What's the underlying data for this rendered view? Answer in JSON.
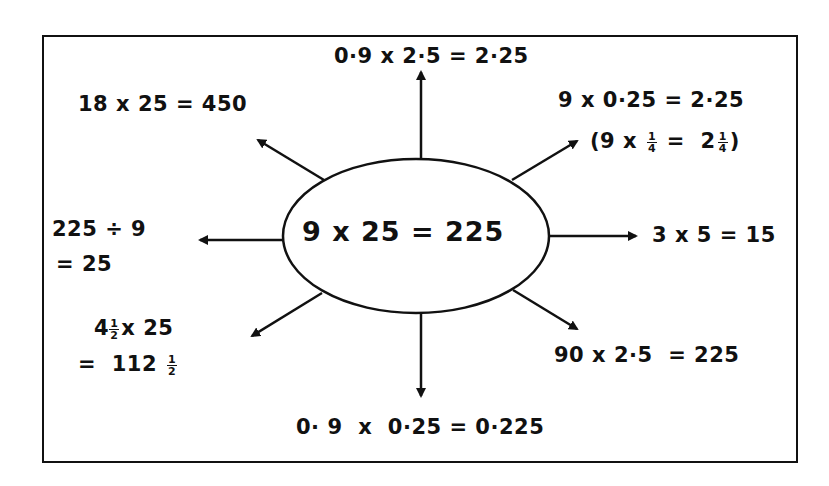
{
  "diagram": {
    "type": "spider-diagram",
    "center": {
      "text": "9 x 25 = 225"
    },
    "branches": [
      {
        "direction": "up",
        "lines": [
          "0·9 x 2·5 = 2·25"
        ]
      },
      {
        "direction": "up-right",
        "lines": [
          "9 x 0·25 = 2·25"
        ],
        "sub": {
          "open": "(9 x",
          "frac1_num": "1",
          "frac1_den": "4",
          "mid": "=  2",
          "frac2_num": "1",
          "frac2_den": "4",
          "close": ")"
        }
      },
      {
        "direction": "right",
        "lines": [
          "3 x 5 = 15"
        ]
      },
      {
        "direction": "down-right",
        "lines": [
          "90 x 2·5  = 225"
        ]
      },
      {
        "direction": "down",
        "lines": [
          "0· 9  x  0·25 = 0·225"
        ]
      },
      {
        "direction": "down-left",
        "line1": {
          "whole": "4",
          "frac_num": "1",
          "frac_den": "2",
          "rest": "x 25"
        },
        "line2": {
          "prefix": "=  112",
          "frac_num": "1",
          "frac_den": "2"
        }
      },
      {
        "direction": "left",
        "lines": [
          "225 ÷ 9",
          "= 25"
        ]
      },
      {
        "direction": "up-left",
        "lines": [
          "18 x 25 = 450"
        ]
      }
    ],
    "colors": {
      "ink": "#111111",
      "background": "#ffffff"
    }
  }
}
